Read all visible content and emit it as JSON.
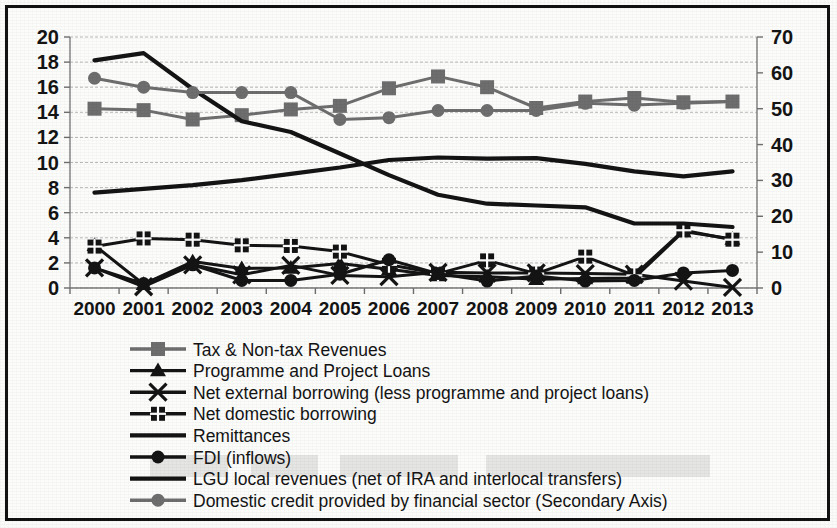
{
  "chart_data": {
    "type": "line",
    "title": "",
    "subtitle": "",
    "xlabel": "",
    "ylabel": "",
    "y2label": "",
    "grid": true,
    "legend_position": "bottom",
    "categories": [
      "2000",
      "2001",
      "2002",
      "2003",
      "2004",
      "2005",
      "2006",
      "2007",
      "2008",
      "2009",
      "2010",
      "2011",
      "2012",
      "2013"
    ],
    "ylim": [
      0,
      20
    ],
    "yticks": [
      0,
      2,
      4,
      6,
      8,
      10,
      12,
      14,
      16,
      18,
      20
    ],
    "y2lim": [
      0,
      70
    ],
    "y2ticks": [
      0,
      10,
      20,
      30,
      40,
      50,
      60,
      70
    ],
    "series": [
      {
        "name": "Tax & Non-tax Revenues",
        "axis": "secondary",
        "marker": "square",
        "color": "#6e6e6e",
        "values": [
          50.0,
          49.6,
          47.0,
          48.2,
          49.8,
          50.8,
          55.7,
          59.0,
          56.0,
          50.2,
          52.0,
          53.0,
          51.8,
          52.0
        ]
      },
      {
        "name": "Programme and Project Loans",
        "axis": "primary",
        "marker": "triangle",
        "color": "#141414",
        "values": [
          3.4,
          0.3,
          2.1,
          1.55,
          1.6,
          1.95,
          1.5,
          1.0,
          0.9,
          0.7,
          0.75,
          0.8,
          4.5,
          3.9
        ]
      },
      {
        "name": "Net external borrowing (less programme and project loans)",
        "axis": "primary",
        "marker": "x",
        "color": "#141414",
        "values": [
          1.6,
          0.1,
          1.85,
          1.05,
          1.8,
          1.0,
          0.9,
          1.25,
          1.2,
          1.2,
          1.15,
          1.1,
          0.55,
          0.05
        ]
      },
      {
        "name": "Net domestic borrowing",
        "axis": "primary",
        "marker": "square-plus",
        "color": "#141414",
        "values": [
          3.3,
          3.95,
          3.85,
          3.4,
          3.35,
          2.9,
          1.85,
          1.15,
          2.2,
          1.15,
          2.5,
          1.0,
          4.6,
          3.85
        ]
      },
      {
        "name": "Remittances",
        "axis": "primary",
        "marker": "none",
        "color": "#141414",
        "values": [
          7.6,
          7.9,
          8.2,
          8.6,
          9.1,
          9.6,
          10.2,
          10.4,
          10.3,
          10.35,
          9.9,
          9.3,
          8.9,
          9.3
        ]
      },
      {
        "name": "FDI (inflows)",
        "axis": "primary",
        "marker": "circle",
        "color": "#141414",
        "values": [
          1.6,
          0.35,
          1.85,
          0.6,
          0.6,
          1.1,
          2.25,
          1.15,
          0.55,
          0.95,
          0.55,
          0.6,
          1.2,
          1.4
        ]
      },
      {
        "name": "LGU local revenues (net of IRA and interlocal transfers)",
        "axis": "secondary",
        "marker": "none",
        "color": "#141414",
        "values": [
          63.5,
          65.5,
          55.5,
          46.5,
          43.5,
          37.5,
          31.5,
          26.0,
          23.5,
          23.0,
          22.5,
          18.0,
          18.0,
          17.0
        ]
      },
      {
        "name": "Domestic credit provided by financial sector (Secondary Axis)",
        "axis": "secondary",
        "marker": "circle",
        "color": "#6e6e6e",
        "values": [
          58.5,
          56.0,
          54.5,
          54.5,
          54.5,
          47.0,
          47.5,
          49.5,
          49.5,
          49.5,
          51.5,
          51.0,
          51.5,
          52.0
        ]
      }
    ],
    "legend": [
      {
        "label": "Tax & Non-tax Revenues",
        "marker": "square",
        "color": "#6e6e6e"
      },
      {
        "label": "Programme and Project Loans",
        "marker": "triangle",
        "color": "#141414"
      },
      {
        "label": "Net external borrowing (less programme and project loans)",
        "marker": "x",
        "color": "#141414"
      },
      {
        "label": "Net domestic borrowing",
        "marker": "square-plus",
        "color": "#141414"
      },
      {
        "label": "Remittances",
        "marker": "none",
        "color": "#141414"
      },
      {
        "label": "FDI (inflows)",
        "marker": "circle",
        "color": "#141414"
      },
      {
        "label": "LGU local revenues (net of IRA and interlocal transfers)",
        "marker": "none",
        "color": "#141414"
      },
      {
        "label": "Domestic credit provided by financial sector (Secondary Axis)",
        "marker": "circle",
        "color": "#6e6e6e"
      }
    ]
  }
}
